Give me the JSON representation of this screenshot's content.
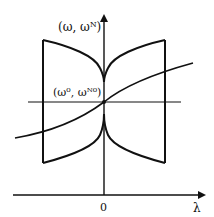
{
  "diagram": {
    "y_axis_label": "(ω, ωᴺ)",
    "point_label": "(ω⁰, ωᴺ⁰)",
    "origin_label": "0",
    "x_axis_label": "λ",
    "stroke_color": "#111111",
    "background": "#ffffff"
  }
}
